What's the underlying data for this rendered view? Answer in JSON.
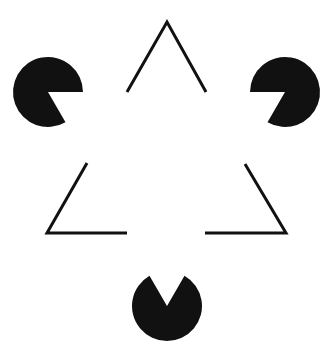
{
  "figure": {
    "background": "#ffffff",
    "ink": "#111111",
    "pacmen": [
      {
        "name": "pacman-left",
        "cx": 48,
        "cy": 92,
        "r": 35,
        "mouth_start_deg": 0,
        "mouth_end_deg": 60
      },
      {
        "name": "pacman-right",
        "cx": 285,
        "cy": 92,
        "r": 35,
        "mouth_start_deg": 120,
        "mouth_end_deg": 180
      },
      {
        "name": "pacman-bottom",
        "cx": 167,
        "cy": 306,
        "r": 35,
        "mouth_start_deg": 240,
        "mouth_end_deg": 300
      }
    ],
    "outline_segments": [
      {
        "name": "top-chevron",
        "points": "127,92 167,22 206,92"
      },
      {
        "name": "bottom-left-corner",
        "points": "87,163 47,233 127,233"
      },
      {
        "name": "bottom-right-corner",
        "points": "245,164 286,233 205,233"
      }
    ],
    "stroke_width": 3
  }
}
